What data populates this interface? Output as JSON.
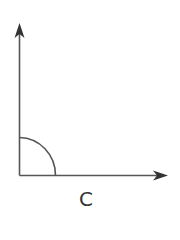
{
  "diagram": {
    "label": "C",
    "stroke_color": "#444444",
    "angle_type": "right-angle",
    "elements": [
      {
        "type": "ray",
        "direction": "up"
      },
      {
        "type": "ray",
        "direction": "right"
      },
      {
        "type": "arc",
        "description": "quarter-circle angle marker at vertex"
      }
    ]
  }
}
